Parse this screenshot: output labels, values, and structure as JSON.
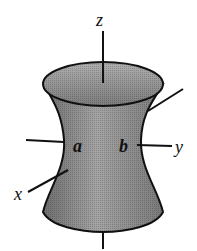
{
  "diagram": {
    "type": "hyperboloid-of-one-sheet",
    "labels": {
      "z_axis": "z",
      "y_axis": "y",
      "x_axis": "x",
      "semi_axis_a": "a",
      "semi_axis_b": "b"
    },
    "colors": {
      "surface_fill": "#8c8c8c",
      "top_cap_fill": "#9a9a9a",
      "outline": "#111111",
      "background": "#ffffff"
    }
  }
}
